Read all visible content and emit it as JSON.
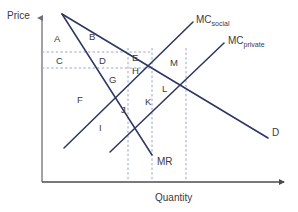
{
  "figure": {
    "type": "economics-diagram",
    "axes": {
      "y_label": "Price",
      "x_label": "Quantity",
      "origin": [
        42,
        182
      ],
      "y_top": [
        42,
        14
      ],
      "x_right": [
        288,
        182
      ]
    },
    "colors": {
      "curve": "#2d3561",
      "axis": "#808088",
      "dashed": "#9aa6c8",
      "text": "#3a3a44"
    },
    "curves": [
      {
        "name": "demand",
        "label": "D",
        "label_pos": [
          272,
          132
        ],
        "from": [
          62,
          14
        ],
        "to": [
          268,
          138
        ]
      },
      {
        "name": "marginal-revenue",
        "label": "MR",
        "label_pos": [
          157,
          162
        ],
        "from": [
          62,
          14
        ],
        "to": [
          152,
          155
        ]
      },
      {
        "name": "mc-social",
        "label": "MC",
        "sub": "social",
        "label_pos": [
          196,
          18
        ],
        "from": [
          64,
          148
        ],
        "to": [
          193,
          22
        ]
      },
      {
        "name": "mc-private",
        "label": "MC",
        "sub": "private",
        "label_pos": [
          228,
          38
        ],
        "from": [
          110,
          152
        ],
        "to": [
          224,
          43
        ]
      }
    ],
    "dashed_lines": [
      {
        "orientation": "horizontal",
        "y": 52,
        "from_x": 42,
        "to_x": 152
      },
      {
        "orientation": "horizontal",
        "y": 68,
        "from_x": 42,
        "to_x": 152
      },
      {
        "orientation": "vertical",
        "x": 128,
        "from_y": 48,
        "to_y": 182
      },
      {
        "orientation": "vertical",
        "x": 152,
        "from_y": 48,
        "to_y": 182
      },
      {
        "orientation": "vertical",
        "x": 186,
        "from_y": 48,
        "to_y": 182
      }
    ],
    "area_labels": [
      {
        "id": "A",
        "x": 54,
        "y": 34
      },
      {
        "id": "B",
        "x": 89,
        "y": 32
      },
      {
        "id": "C",
        "x": 56,
        "y": 56
      },
      {
        "id": "D",
        "x": 99,
        "y": 56
      },
      {
        "id": "E",
        "x": 132,
        "y": 53
      },
      {
        "id": "H",
        "x": 132,
        "y": 66
      },
      {
        "id": "M",
        "x": 170,
        "y": 58
      },
      {
        "id": "F",
        "x": 77,
        "y": 95
      },
      {
        "id": "G",
        "x": 109,
        "y": 75
      },
      {
        "id": "J",
        "x": 121,
        "y": 105
      },
      {
        "id": "K",
        "x": 145,
        "y": 97
      },
      {
        "id": "L",
        "x": 162,
        "y": 84
      },
      {
        "id": "I",
        "x": 99,
        "y": 123
      }
    ]
  }
}
